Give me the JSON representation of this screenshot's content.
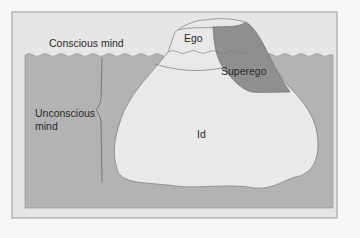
{
  "diagram": {
    "labels": {
      "conscious": "Conscious mind",
      "unconscious_line1": "Unconscious",
      "unconscious_line2": "mind",
      "ego": "Ego",
      "superego": "Superego",
      "id": "Id"
    },
    "colors": {
      "background": "#f7f7f7",
      "frame": "#e6e6e6",
      "frame_border": "#9a9a9a",
      "water": "#b3b3b3",
      "iceberg": "#e9e9e9",
      "superego": "#8f8f8f",
      "outline": "#7a7a7a"
    }
  }
}
